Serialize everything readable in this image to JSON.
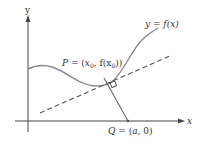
{
  "diagram": {
    "axes": {
      "x_label": "x",
      "y_label": "y"
    },
    "curve_label": {
      "lhs": "y",
      "eq": " = ",
      "rhs": "f(x)"
    },
    "point_p": {
      "name": "P",
      "eq": " = (",
      "x0": "x",
      "sub0": "0",
      "mid": ", f(x",
      "sub1": "0",
      "end": "))"
    },
    "point_q": {
      "name": "Q",
      "eq": " = (",
      "a": "a",
      "end": ", 0)"
    },
    "colors": {
      "axis": "#444444",
      "curve": "#8a8a8a",
      "dashed": "#555555",
      "normal": "#666666",
      "text": "#333333"
    }
  }
}
